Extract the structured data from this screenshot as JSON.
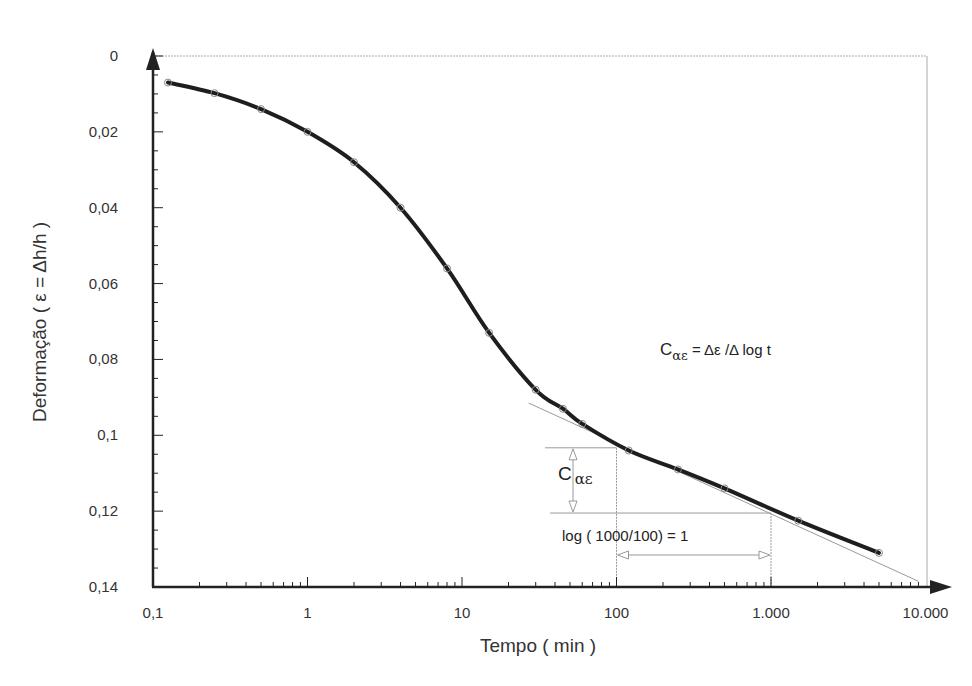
{
  "chart_data": {
    "type": "line",
    "title": "",
    "xlabel": "Tempo ( min )",
    "ylabel": "Deformação ( ε = Δh/h )",
    "x_scale": "log",
    "y_inverted": true,
    "xlim": [
      0.1,
      13000
    ],
    "ylim": [
      0,
      0.14
    ],
    "x_ticks": [
      {
        "value": 0.1,
        "label": "0,1"
      },
      {
        "value": 1,
        "label": "1"
      },
      {
        "value": 10,
        "label": "10"
      },
      {
        "value": 100,
        "label": "100"
      },
      {
        "value": 1000,
        "label": "1.000"
      },
      {
        "value": 10000,
        "label": "10.000"
      }
    ],
    "y_ticks": [
      {
        "value": 0,
        "label": "0"
      },
      {
        "value": 0.02,
        "label": "0,02"
      },
      {
        "value": 0.04,
        "label": "0,04"
      },
      {
        "value": 0.06,
        "label": "0,06"
      },
      {
        "value": 0.08,
        "label": "0,08"
      },
      {
        "value": 0.1,
        "label": "0,1"
      },
      {
        "value": 0.12,
        "label": "0,12"
      },
      {
        "value": 0.14,
        "label": "0,14"
      }
    ],
    "grid": false,
    "legend": null,
    "series": [
      {
        "name": "Deformação vs tempo",
        "x": [
          0.125,
          0.25,
          0.5,
          1,
          2,
          4,
          8,
          15,
          30,
          45,
          60,
          120,
          250,
          500,
          1500,
          5000
        ],
        "y": [
          0.007,
          0.0098,
          0.014,
          0.02,
          0.028,
          0.04,
          0.056,
          0.073,
          0.088,
          0.093,
          0.097,
          0.104,
          0.109,
          0.114,
          0.1225,
          0.131
        ]
      }
    ],
    "tangent_line": {
      "x": [
        27,
        9000
      ],
      "y": [
        0.0915,
        0.1385
      ]
    },
    "annotations": [
      {
        "text_main": "C",
        "text_sub": "αε",
        "text_rest": " = Δε /Δ log t",
        "x": 660,
        "y": 355
      },
      {
        "text_main": "C",
        "text_sub": "αε",
        "x": 558,
        "y": 480
      },
      {
        "text": "log ( 1000/100) = 1",
        "x": 560,
        "y": 540
      }
    ]
  },
  "labels": {
    "x_axis_title": "Tempo ( min )",
    "y_axis_title": "Deformação ( ε = Δh/h )",
    "formula_main": "C",
    "formula_sub": "αε",
    "formula_rest": " = Δε /Δ log t",
    "calpha_main": "C",
    "calpha_sub": "αε",
    "log_label": "log ( 1000/100) = 1"
  },
  "colors": {
    "curve": "#1e1e1e",
    "axis": "#222222",
    "guide": "#9a9a9a",
    "marker": "#888888",
    "text": "#333333"
  }
}
